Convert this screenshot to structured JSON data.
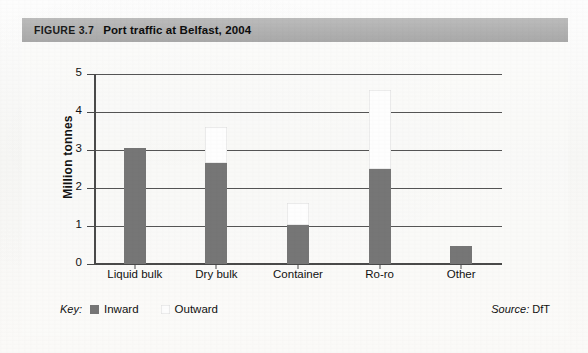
{
  "figure": {
    "number": "FIGURE 3.7",
    "title": "Port traffic at Belfast, 2004",
    "source_label": "Source:",
    "source_value": "DfT",
    "key_label": "Key:"
  },
  "chart_data": {
    "type": "bar",
    "title": "Port traffic at Belfast, 2004",
    "subtitle": "",
    "xlabel": "",
    "ylabel": "Million tonnes",
    "ylim": [
      0,
      5
    ],
    "yticks": [
      "0",
      "1",
      "2",
      "3",
      "4",
      "5"
    ],
    "grid": true,
    "stacked": true,
    "legend_position": "bottom-left",
    "categories": [
      "Liquid bulk",
      "Dry bulk",
      "Container",
      "Ro-ro",
      "Other"
    ],
    "series": [
      {
        "name": "Inward",
        "color": "#767676",
        "values": [
          3.05,
          2.67,
          1.02,
          2.5,
          0.47
        ]
      },
      {
        "name": "Outward",
        "color": "#fefefe",
        "values": [
          0.0,
          0.93,
          0.58,
          2.08,
          0.0
        ]
      }
    ],
    "totals": [
      3.05,
      3.6,
      1.6,
      4.58,
      0.47
    ]
  }
}
